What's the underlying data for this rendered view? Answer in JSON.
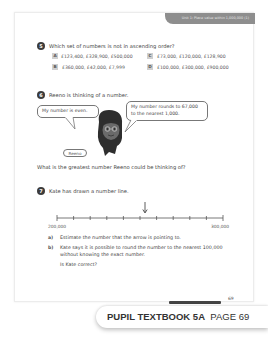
{
  "header": {
    "unit_label": "Unit 1: Place value within 1,000,000 (1)"
  },
  "questions": [
    {
      "number": "5",
      "text": "Which set of numbers is not in ascending order?",
      "options": [
        {
          "letter": "A",
          "value": "£123,400, £328,900, £500,000"
        },
        {
          "letter": "B",
          "value": "£360,000, £42,000, £7,999"
        },
        {
          "letter": "C",
          "value": "£73,000, £120,000, £128,900"
        },
        {
          "letter": "D",
          "value": "£100,000, £300,000, £900,000"
        }
      ]
    },
    {
      "number": "6",
      "text": "Reeno is thinking of a number.",
      "bubble_left": "My number is even.",
      "bubble_right": "My number rounds to 67,000 to the nearest 1,000.",
      "character_name": "Reeno",
      "prompt": "What is the greatest number Reeno could be thinking of?"
    },
    {
      "number": "7",
      "text": "Kate has drawn a number line.",
      "number_line": {
        "start": "200,000",
        "end": "300,000",
        "ticks": 11,
        "arrow_tick_index": 5
      },
      "parts": [
        {
          "label": "a)",
          "text": "Estimate the number that the arrow is pointing to."
        },
        {
          "label": "b)",
          "text_line1": "Kate says it is possible to round the number to the nearest 100,000",
          "text_line2": "without knowing the exact number.",
          "text_line3": "Is Kate correct?"
        }
      ]
    }
  ],
  "footer": {
    "page_number": "69"
  },
  "badge": {
    "book": "PUPIL TEXTBOOK 5A",
    "page": "PAGE 69"
  }
}
